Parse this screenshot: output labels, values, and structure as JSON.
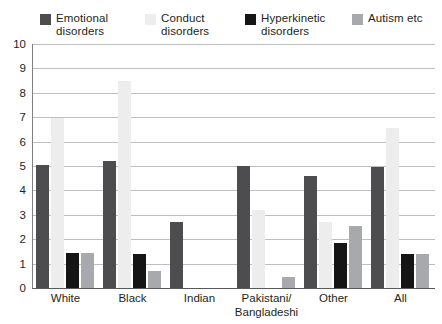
{
  "chart_data": {
    "type": "bar",
    "title": "",
    "subtitle": "",
    "xlabel": "",
    "ylabel": "",
    "ylim": [
      0,
      10
    ],
    "yticks": [
      "0",
      "1",
      "2",
      "3",
      "4",
      "5",
      "6",
      "7",
      "8",
      "9",
      "10"
    ],
    "grid": true,
    "legend_position": "top",
    "categories": [
      "White",
      "Black",
      "Indian",
      "Pakistani/\nBangladeshi",
      "Other",
      "All"
    ],
    "series": [
      {
        "name": "Emotional\ndisorders",
        "color": "#4d4d4f",
        "values": [
          5.05,
          5.2,
          2.7,
          5.0,
          4.6,
          4.95
        ]
      },
      {
        "name": "Conduct\ndisorders",
        "color": "#ededed",
        "values": [
          6.95,
          8.5,
          0,
          3.2,
          2.7,
          6.55
        ]
      },
      {
        "name": "Hyperkinetic\ndisorders",
        "color": "#151515",
        "values": [
          1.45,
          1.4,
          0,
          0,
          1.85,
          1.4
        ]
      },
      {
        "name": "Autism etc",
        "color": "#a7a9ac",
        "values": [
          1.45,
          0.7,
          0,
          0.45,
          2.55,
          1.4
        ]
      }
    ]
  }
}
